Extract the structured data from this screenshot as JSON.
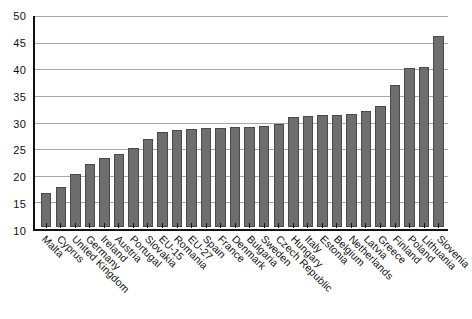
{
  "chart_data": {
    "type": "bar",
    "title": "",
    "subtitle": "",
    "xlabel": "",
    "ylabel": "",
    "ylim": [
      10,
      50
    ],
    "ytick_step": 5,
    "yticks": [
      10,
      15,
      20,
      25,
      30,
      35,
      40,
      45,
      50
    ],
    "grid": true,
    "legend": "none",
    "bar_color": "#6e6e6e",
    "bar_border_color": "#4a4a4a",
    "axis_color": "#111111",
    "gridline_color": "#a8a8a8",
    "background": "#ffffff",
    "categories": [
      "Malta",
      "Cyprus",
      "United Kingdom",
      "Germany",
      "Ireland",
      "Austria",
      "Portugal",
      "Slovakia",
      "EU-15",
      "Romania",
      "EU-27",
      "Spain",
      "France",
      "Denmark",
      "Bulgaria",
      "Sweden",
      "Czech Republic",
      "Hungary",
      "Italy",
      "Estonia",
      "Belgium",
      "Netherlands",
      "Latvia",
      "Greece",
      "Finland",
      "Poland",
      "Lithuania",
      "Slovenia"
    ],
    "values": [
      16.5,
      17.5,
      20.0,
      22.0,
      23.0,
      23.8,
      25.0,
      26.6,
      28.0,
      28.3,
      28.5,
      28.7,
      28.8,
      29.0,
      29.0,
      29.2,
      29.6,
      30.8,
      31.0,
      31.2,
      31.3,
      31.4,
      32.0,
      32.9,
      37.0,
      40.1,
      40.3,
      46.3
    ]
  }
}
